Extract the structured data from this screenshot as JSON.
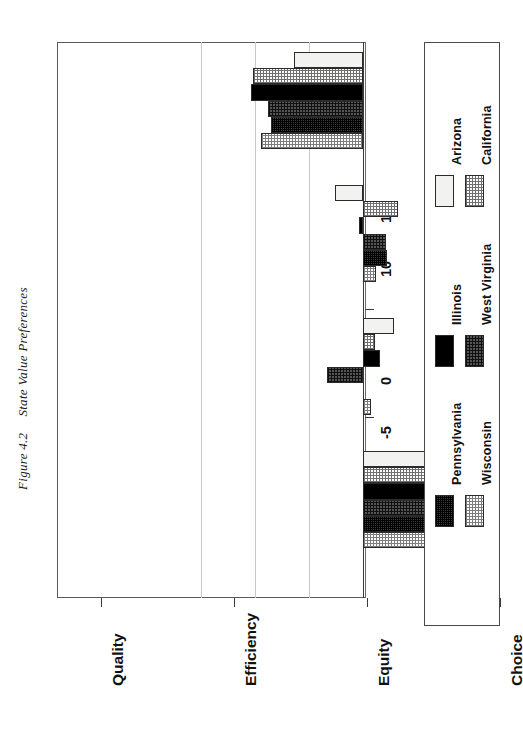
{
  "figure": {
    "number": "Figure 4.2",
    "caption": "State Value Preferences"
  },
  "axis": {
    "tick_labels": [
      "15",
      "10",
      "5",
      "0",
      "-5",
      "-10",
      "-15"
    ],
    "tick_values": [
      15,
      10,
      5,
      0,
      -5,
      -10,
      -15
    ],
    "min": -15,
    "max": 15
  },
  "categories": [
    "Quality",
    "Efficiency",
    "Equity",
    "Choice"
  ],
  "legend": {
    "entries": [
      {
        "label": "Arizona",
        "key": "arizona",
        "color": "#f2f2f0",
        "pattern": "solid-light"
      },
      {
        "label": "California",
        "key": "california",
        "color": "#9a9a9a",
        "pattern": "checker-medium"
      },
      {
        "label": "Illinois",
        "key": "illinois",
        "color": "#000000",
        "pattern": "solid-black"
      },
      {
        "label": "West Virginia",
        "key": "westvirginia",
        "color": "#555555",
        "pattern": "checker-dark"
      },
      {
        "label": "Pennsylvania",
        "key": "pennsylvania",
        "color": "#3d3d3d",
        "pattern": "checker-very-dark"
      },
      {
        "label": "Wisconsin",
        "key": "wisconsin",
        "color": "#b5b5b5",
        "pattern": "checker-light"
      }
    ]
  },
  "chart_data": {
    "type": "bar",
    "title": "State Value Preferences",
    "subtitle": "Figure 4.2",
    "orientation": "vertical-rotated",
    "xlabel": "",
    "ylabel": "",
    "ylim": [
      -15,
      15
    ],
    "grid": true,
    "legend_position": "right",
    "categories": [
      "Quality",
      "Efficiency",
      "Equity",
      "Choice"
    ],
    "series": [
      {
        "name": "Arizona",
        "values": [
          6.4,
          2.6,
          -2.9,
          -5.9
        ]
      },
      {
        "name": "California",
        "values": [
          10.2,
          -3.2,
          -1.1,
          -6.3
        ]
      },
      {
        "name": "Illinois",
        "values": [
          10.4,
          0.4,
          -1.6,
          -9.6
        ]
      },
      {
        "name": "West Virginia",
        "values": [
          8.8,
          -2.1,
          3.3,
          -9.3
        ]
      },
      {
        "name": "Pennsylvania",
        "values": [
          8.5,
          -2.2,
          0.0,
          -9.8
        ]
      },
      {
        "name": "Wisconsin",
        "values": [
          9.4,
          -1.2,
          -0.7,
          -7.5
        ]
      }
    ]
  }
}
